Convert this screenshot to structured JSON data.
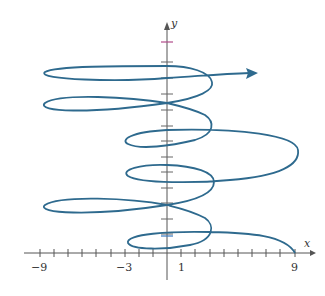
{
  "figure": {
    "x_axis_label": "x",
    "y_axis_label": "y",
    "x_tick_labels": [
      {
        "value": -9,
        "text": "−9"
      },
      {
        "value": -3,
        "text": "−3"
      },
      {
        "value": 1,
        "text": "1"
      },
      {
        "value": 9,
        "text": "9"
      }
    ],
    "curve_color": "#2e6a8e",
    "axis_color": "#555555",
    "highlight_tick_color": "#b04a8a"
  }
}
